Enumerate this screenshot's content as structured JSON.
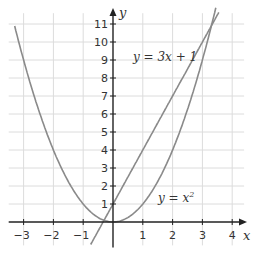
{
  "chart_data": {
    "type": "line",
    "title": "",
    "xlabel": "x",
    "ylabel": "y",
    "xlim": [
      -3.5,
      4.4
    ],
    "ylim": [
      -1.3,
      11.6
    ],
    "grid": true,
    "x_ticks": [
      -3,
      -2,
      -1,
      1,
      2,
      3,
      4
    ],
    "y_ticks": [
      1,
      2,
      3,
      4,
      5,
      6,
      7,
      8,
      9,
      10,
      11
    ],
    "series": [
      {
        "name": "y = x²",
        "label": "y = x",
        "sup": "2",
        "equation": "x^2",
        "x_range": [
          -3.3,
          3.45
        ],
        "color": "#8a8a8a"
      },
      {
        "name": "y = 3x + 1",
        "label": "y = 3x + 1",
        "equation": "3x+1",
        "x_range": [
          -0.75,
          3.55
        ],
        "color": "#8a8a8a"
      }
    ],
    "intersections": [
      [
        -0.3,
        0.09
      ],
      [
        3.3,
        10.91
      ]
    ]
  }
}
